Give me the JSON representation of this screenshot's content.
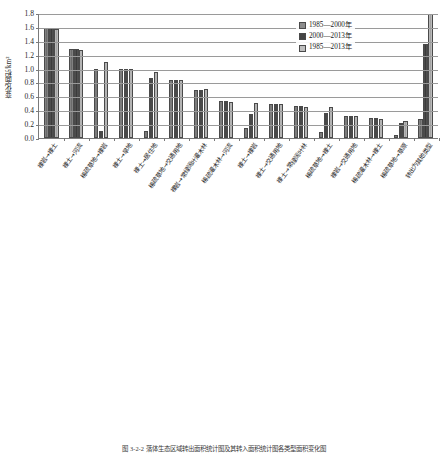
{
  "figure": {
    "caption": "图 3-2-2  落体生态区域转出面积统计图及其转入面积统计图各类型面积变化图"
  },
  "legend": {
    "position": "top-right",
    "items": [
      {
        "label": "1985—2000年",
        "color": "#8c8c8c"
      },
      {
        "label": "2000—2013年",
        "color": "#454545"
      },
      {
        "label": "1985—2013年",
        "color": "#bfbfbf"
      }
    ]
  },
  "chart_data": [
    {
      "id": "top",
      "type": "bar",
      "title": "",
      "xlabel": "",
      "ylabel": "变化面积/km²",
      "ylim": [
        0.0,
        1.8
      ],
      "yticks": [
        "0.0",
        "0.2",
        "0.4",
        "0.6",
        "0.8",
        "1.0",
        "1.2",
        "1.4",
        "1.6",
        "1.8"
      ],
      "grid": true,
      "legend_position": "top-right",
      "categories": [
        "裸岩→裸土",
        "裸土→河流",
        "稀疏草地→裸岩",
        "裸土→旱地",
        "裸土→居住地",
        "稀疏草地→交通用地",
        "裸岩→常绿阔叶灌木林",
        "稀疏灌木林→河流",
        "裸土→裸岩",
        "裸土→交通用地",
        "裸土→常绿阔叶林",
        "稀疏草地→裸土",
        "裸岩→交通用地",
        "稀疏灌木林→裸土",
        "稀疏草地→草原",
        "转出为其他类型"
      ],
      "series": [
        {
          "name": "1985—2000年",
          "values": [
            1.59,
            1.28,
            1.0,
            0.99,
            0.1,
            0.84,
            0.69,
            0.53,
            0.15,
            0.49,
            0.46,
            0.09,
            0.32,
            0.29,
            0.05,
            0.28
          ]
        },
        {
          "name": "2000—2013年",
          "values": [
            1.59,
            1.28,
            0.1,
            0.99,
            0.86,
            0.84,
            0.69,
            0.53,
            0.35,
            0.49,
            0.46,
            0.36,
            0.32,
            0.29,
            0.21,
            1.35
          ]
        },
        {
          "name": "1985—2013年",
          "values": [
            1.57,
            1.27,
            1.1,
            0.99,
            0.95,
            0.84,
            0.7,
            0.52,
            0.5,
            0.49,
            0.44,
            0.44,
            0.32,
            0.28,
            0.24,
            1.78
          ]
        }
      ]
    },
    {
      "id": "bottom",
      "type": "bar",
      "title": "",
      "xlabel": "",
      "ylabel": "变化面积/km²",
      "ylim": [
        0.0,
        40.0
      ],
      "yticks": [
        "0.0",
        "8.0",
        "16.0",
        "24.0",
        "32.0",
        "40.0"
      ],
      "grid": true,
      "legend_position": "top-right",
      "categories": [
        "常绿针叶林→裸土",
        "旱地→裸土",
        "落叶阔叶灌木林→裸土",
        "落叶阔叶灌木林→裸岩",
        "常绿阔叶林→裸土",
        "针阔混交林→裸土",
        "常绿针叶林→裸岩",
        "常绿阔叶林→裸岩",
        "常绿阔叶灌木林→裸土",
        "常绿针叶灌木林→裸土",
        "草原→裸土",
        "草原→裸岩",
        "针阔混交林→裸岩",
        "常绿阔叶灌木林→裸岩",
        "裸岩→裸土",
        "稀疏草地→裸岩",
        "其他类型转入"
      ],
      "series": [
        {
          "name": "1985—2000年",
          "values": [
            36.0,
            29.5,
            17.2,
            11.2,
            8.8,
            7.9,
            7.9,
            7.8,
            5.5,
            3.2,
            3.1,
            2.1,
            2.0,
            1.3,
            1.2,
            0.6,
            6.9
          ]
        },
        {
          "name": "2000—2013年",
          "values": [
            36.0,
            29.5,
            17.2,
            11.2,
            8.8,
            7.9,
            7.9,
            7.8,
            5.5,
            3.2,
            3.1,
            2.1,
            2.0,
            1.3,
            1.2,
            0.6,
            6.9
          ]
        },
        {
          "name": "1985—2013年",
          "values": [
            36.0,
            29.4,
            17.1,
            10.5,
            8.6,
            7.9,
            7.9,
            7.8,
            5.4,
            3.1,
            3.0,
            2.0,
            1.9,
            1.2,
            1.1,
            0.6,
            6.9
          ]
        }
      ]
    }
  ]
}
